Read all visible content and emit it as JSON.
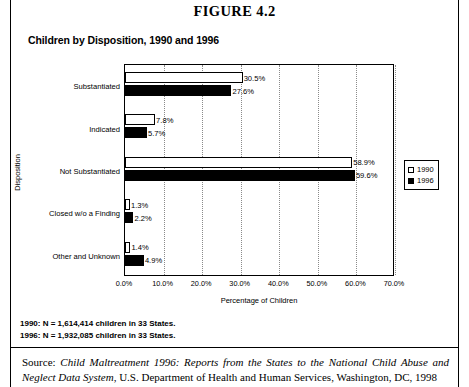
{
  "figure": {
    "number": "FIGURE 4.2",
    "subtitle": "Children by Disposition, 1990 and 1996"
  },
  "notes": {
    "line1": "1990: N = 1,614,414 children in 33 States.",
    "line2": "1996: N = 1,932,085 children in 33 States."
  },
  "source": {
    "prefix": "Source: ",
    "title": "Child Maltreatment 1996: Reports from the States to the National Child Abuse and Neglect Data System",
    "rest": ", U.S. Department of Health and Human Services, Washington, DC, 1998"
  },
  "legend": {
    "items": [
      {
        "label": "1990",
        "color": "#ffffff"
      },
      {
        "label": "1996",
        "color": "#000000"
      }
    ]
  },
  "chart_data": {
    "type": "bar",
    "orientation": "horizontal",
    "title": "Children by Disposition, 1990 and 1996",
    "xlabel": "Percentage of Children",
    "ylabel": "Disposition",
    "xlim": [
      0,
      70
    ],
    "xticks": [
      "0.0%",
      "10.0%",
      "20.0%",
      "30.0%",
      "40.0%",
      "50.0%",
      "60.0%",
      "70.0%"
    ],
    "xtick_values": [
      0,
      10,
      20,
      30,
      40,
      50,
      60,
      70
    ],
    "grid": "vertical-dotted",
    "legend_position": "right",
    "categories": [
      "Substantiated",
      "Indicated",
      "Not Substantiated",
      "Closed w/o a Finding",
      "Other and Unknown"
    ],
    "series": [
      {
        "name": "1990",
        "color": "#ffffff",
        "values": [
          30.5,
          7.8,
          58.9,
          1.3,
          1.4
        ],
        "labels": [
          "30.5%",
          "7.8%",
          "58.9%",
          "1.3%",
          "1.4%"
        ]
      },
      {
        "name": "1996",
        "color": "#000000",
        "values": [
          27.6,
          5.7,
          59.6,
          2.2,
          4.9
        ],
        "labels": [
          "27.6%",
          "5.7%",
          "59.6%",
          "2.2%",
          "4.9%"
        ]
      }
    ]
  }
}
